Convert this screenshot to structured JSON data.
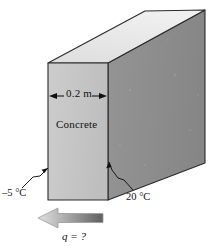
{
  "figure": {
    "type": "engineering-diagram",
    "width_px": 216,
    "height_px": 249,
    "background_color": "#ffffff"
  },
  "labels": {
    "thickness": "0.2 m",
    "material": "Concrete",
    "temp_cold": "–5 °C",
    "temp_hot": "20 °C",
    "heat_flux": "q = ?"
  },
  "slab": {
    "shape": "rectangular-block",
    "thickness": "0.2 m",
    "material": "Concrete",
    "faces": {
      "top": {
        "name": "top-face",
        "fill": "#e8e8e8"
      },
      "front": {
        "name": "front-face",
        "fill": "#c6c6c6"
      },
      "side": {
        "name": "side-face",
        "fill": "#8e8e8e"
      }
    },
    "outline_color": "#2b2b2b"
  },
  "annotations": {
    "dimension_arrow": {
      "name": "thickness-dimension-arrow",
      "label": "0.2 m",
      "orientation": "horizontal-double-headed"
    },
    "leader_cold": {
      "name": "cold-side-leader-line",
      "points_to": "left-face",
      "label": "–5 °C"
    },
    "leader_hot": {
      "name": "hot-side-leader-line",
      "points_to": "bottom-front-edge",
      "label": "20 °C"
    },
    "flux_arrow": {
      "name": "heat-flux-arrow",
      "direction": "left",
      "label": "q = ?",
      "gradient_from": "#6e6e6e",
      "gradient_to": "#dcdcdc"
    }
  },
  "colors": {
    "top_face": "#e8e8e8",
    "front_face": "#c6c6c6",
    "side_face": "#8e8e8e",
    "outline": "#2b2b2b",
    "text": "#111111",
    "arrow_dark": "#6e6e6e",
    "arrow_light": "#dcdcdc"
  }
}
